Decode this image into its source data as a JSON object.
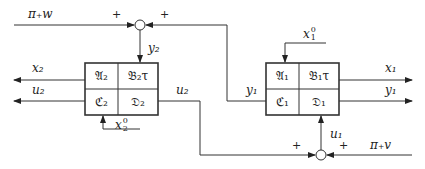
{
  "diagram": {
    "type": "block-diagram-feedback-interconnection",
    "blocks": [
      {
        "id": "system-2",
        "cells": {
          "top_left": "𝔄₂",
          "top_right": "𝔅₂τ",
          "bottom_left": "ℭ₂",
          "bottom_right": "𝔇₂"
        },
        "initial_state_label": {
          "base": "x",
          "sup": "0",
          "sub": "2"
        }
      },
      {
        "id": "system-1",
        "cells": {
          "top_left": "𝔄₁",
          "top_right": "𝔅₁τ",
          "bottom_left": "ℭ₁",
          "bottom_right": "𝔇₁"
        },
        "initial_state_label": {
          "base": "x",
          "sup": "0",
          "sub": "1"
        }
      }
    ],
    "summing_junctions": [
      {
        "id": "top",
        "signs": [
          "+",
          "+"
        ],
        "input_label": "π₊w",
        "output_label": "y₂"
      },
      {
        "id": "bottom",
        "signs": [
          "+",
          "+"
        ],
        "input_label": "π₊v",
        "output_label": "u₁"
      }
    ],
    "signals": {
      "x2": "x₂",
      "u2_left": "u₂",
      "u2_right": "u₂",
      "y2": "y₂",
      "x1": "x₁",
      "y1_left": "y₁",
      "y1_right": "y₁",
      "u1": "u₁",
      "w_input": "π₊w",
      "v_input": "π₊v"
    },
    "plus_sign": "+"
  }
}
